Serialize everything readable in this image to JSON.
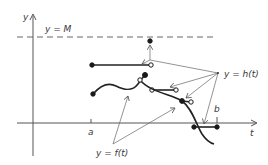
{
  "labels": {
    "y_axis": "y",
    "t_axis": "t",
    "bound": "y = M",
    "tick_a": "a",
    "tick_b": "b",
    "f_label": "y = f(t)",
    "h_label": "y = h(t)"
  },
  "colors": {
    "ink": "#1a1a1a",
    "axis": "#555555",
    "background": "#ffffff"
  }
}
